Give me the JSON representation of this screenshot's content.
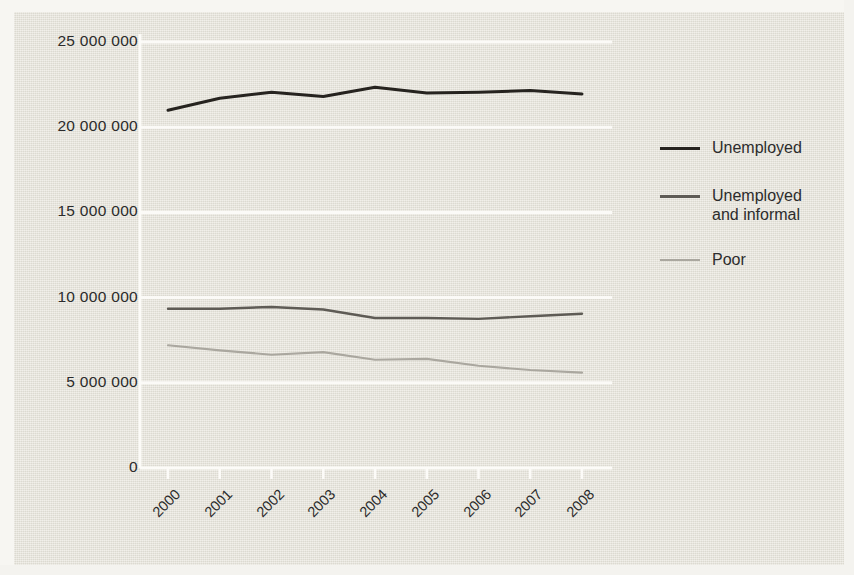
{
  "figure": {
    "background_color": "#e8e6dd",
    "plot": {
      "x_left_px": 168,
      "x_right_px": 582,
      "y_zero_px": 468,
      "y_top_px": 42
    }
  },
  "chart_data": {
    "type": "line",
    "title": "",
    "subtitle": "",
    "xlabel": "",
    "ylabel": "",
    "categories": [
      "2000",
      "2001",
      "2002",
      "2003",
      "2004",
      "2005",
      "2006",
      "2007",
      "2008"
    ],
    "x_tick_labels": [
      "2000",
      "2001",
      "2002",
      "2003",
      "2004",
      "2005",
      "2006",
      "2007",
      "2008"
    ],
    "y_tick_labels": [
      "25 000 000",
      "20 000 000",
      "15 000 000",
      "10 000 000",
      "5 000 000",
      "0"
    ],
    "y_tick_values": [
      25000000,
      20000000,
      15000000,
      10000000,
      5000000,
      0
    ],
    "ylim": [
      0,
      25000000
    ],
    "grid": "horizontal-white-gridlines",
    "legend_position": "right",
    "series": [
      {
        "name": "Unemployed",
        "color": "#26231f",
        "values": [
          21000000,
          21700000,
          22050000,
          21800000,
          22350000,
          22000000,
          22050000,
          22150000,
          21950000
        ]
      },
      {
        "name": "Unemployed\nand informal",
        "color": "#5e5b55",
        "values": [
          9350000,
          9350000,
          9450000,
          9300000,
          8800000,
          8800000,
          8750000,
          8900000,
          9050000
        ]
      },
      {
        "name": "Poor",
        "color": "#aaa79f",
        "values": [
          7200000,
          6900000,
          6650000,
          6800000,
          6350000,
          6400000,
          6000000,
          5750000,
          5600000
        ]
      }
    ]
  },
  "legend": {
    "items": [
      {
        "label": "Unemployed",
        "color": "#26231f"
      },
      {
        "label": "Unemployed\nand informal",
        "color": "#5e5b55"
      },
      {
        "label": "Poor",
        "color": "#aaa79f"
      }
    ]
  }
}
